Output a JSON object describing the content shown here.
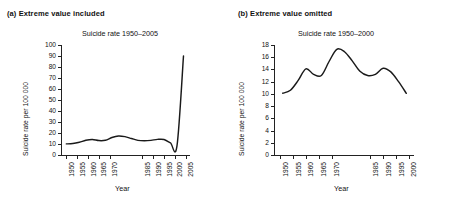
{
  "figure": {
    "x_axis_title": "Year",
    "y_axis_title": "Suicide rate per 100 000"
  },
  "panel_a": {
    "caption": "(a) Extreme value included",
    "title": "Suicide rate 1950–2005",
    "x_axis_title": "Year",
    "y_axis_title": "Suicide rate per 100 000"
  },
  "panel_b": {
    "caption": "(b) Extreme value omitted",
    "title": "Suicide rate 1950–2000",
    "x_axis_title": "Year",
    "y_axis_title": "Suicide rate per 100 000"
  },
  "chart_data": [
    {
      "type": "line",
      "panel": "a",
      "title": "Suicide rate 1950–2005",
      "xlabel": "Year",
      "ylabel": "Suicide rate per 100 000",
      "xlim": [
        1948,
        2007
      ],
      "ylim": [
        0,
        100
      ],
      "ytick_step": 10,
      "yticks": [
        0,
        10,
        20,
        30,
        40,
        50,
        60,
        70,
        80,
        90,
        100
      ],
      "xticks": [
        1950,
        1955,
        1960,
        1965,
        1970,
        1985,
        1990,
        1995,
        2000,
        2005
      ],
      "grid": false,
      "legend": false,
      "annotation": "Extreme value included: the outlier near 2005 inflates the y-axis so the earlier variation is compressed into a flat line.",
      "x": [
        1950,
        1953,
        1956,
        1959,
        1962,
        1965,
        1968,
        1971,
        1974,
        1977,
        1980,
        1983,
        1986,
        1989,
        1992,
        1995,
        1998,
        2001,
        2004
      ],
      "values": [
        10.1,
        10.4,
        11.6,
        13.4,
        14.1,
        13.1,
        13.4,
        15.9,
        17.3,
        16.7,
        15.0,
        13.3,
        12.9,
        13.3,
        14.2,
        14.1,
        11.0,
        8.2,
        90.0
      ]
    },
    {
      "type": "line",
      "panel": "b",
      "title": "Suicide rate 1950–2000",
      "xlabel": "Year",
      "ylabel": "Suicide rate per 100 000",
      "xlim": [
        1948,
        2002
      ],
      "ylim": [
        0,
        18
      ],
      "ytick_step": 2,
      "yticks": [
        0,
        2,
        4,
        6,
        8,
        10,
        12,
        14,
        16,
        18
      ],
      "xticks": [
        1950,
        1955,
        1960,
        1965,
        1970,
        1985,
        1990,
        1995,
        2000
      ],
      "grid": false,
      "legend": false,
      "annotation": "Extreme value omitted: with the outlier removed the y-axis rescales and the real pattern of peaks and troughs becomes visible.",
      "x": [
        1951,
        1954,
        1957,
        1960,
        1963,
        1966,
        1969,
        1972,
        1975,
        1978,
        1981,
        1984,
        1987,
        1990,
        1993,
        1996,
        1999
      ],
      "values": [
        10.1,
        10.6,
        12.2,
        14.1,
        13.2,
        13.0,
        15.3,
        17.3,
        16.9,
        15.4,
        13.7,
        13.0,
        13.2,
        14.2,
        13.6,
        12.0,
        10.1
      ]
    }
  ]
}
